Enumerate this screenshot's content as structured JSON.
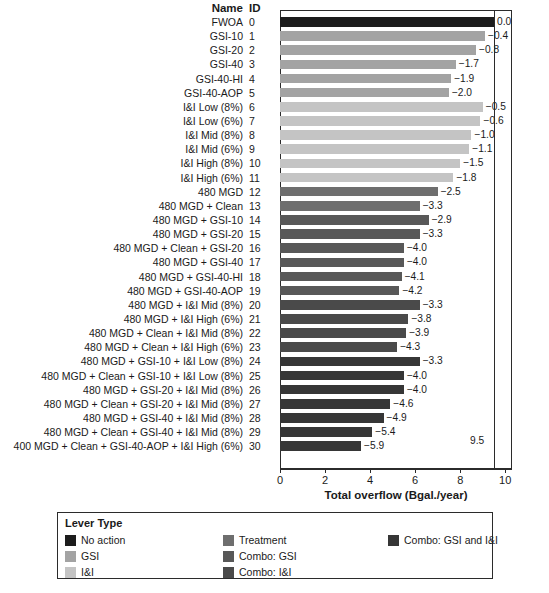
{
  "header": {
    "name_col": "Name",
    "id_col": "ID"
  },
  "chart_data": {
    "type": "bar",
    "title": "",
    "xlabel": "Total overflow (Bgal./year)",
    "ylabel": "",
    "xlim": [
      0,
      10.3
    ],
    "xticks": [
      0,
      2,
      4,
      6,
      8,
      10
    ],
    "xticklabels": [
      "0",
      "2",
      "4",
      "6",
      "8",
      "10"
    ],
    "grid": false,
    "orientation": "horizontal",
    "reference_line": {
      "value": 9.5,
      "label": "9.5"
    },
    "legend_position": "bottom",
    "categories": [
      "FWOA",
      "GSI-10",
      "GSI-20",
      "GSI-40",
      "GSI-40-HI",
      "GSI-40-AOP",
      "I&I Low (8%)",
      "I&I Low (6%)",
      "I&I Mid (8%)",
      "I&I Mid (6%)",
      "I&I High (8%)",
      "I&I High (6%)",
      "480 MGD",
      "480 MGD + Clean",
      "480 MGD + GSI-10",
      "480 MGD + GSI-20",
      "480 MGD + Clean + GSI-20",
      "480 MGD + GSI-40",
      "480 MGD + GSI-40-HI",
      "480 MGD + GSI-40-AOP",
      "480 MGD + I&I Mid (8%)",
      "480 MGD + I&I High (6%)",
      "480 MGD + Clean + I&I Mid (8%)",
      "480 MGD + Clean + I&I High (6%)",
      "480 MGD + GSI-10 + I&I Low (8%)",
      "480 MGD + Clean + GSI-10 + I&I Low (8%)",
      "480 MGD + GSI-20 + I&I Mid (8%)",
      "480 MGD + Clean + GSI-20 + I&I Mid (8%)",
      "480 MGD + GSI-40 + I&I Mid (8%)",
      "480 MGD + Clean + GSI-40 + I&I Mid (8%)",
      "400 MGD + Clean + GSI-40-AOP + I&I High (6%)"
    ],
    "ids": [
      0,
      1,
      2,
      3,
      4,
      5,
      6,
      7,
      8,
      9,
      10,
      11,
      12,
      13,
      14,
      15,
      16,
      17,
      18,
      19,
      20,
      21,
      22,
      23,
      24,
      25,
      26,
      27,
      28,
      29,
      30
    ],
    "values": [
      9.5,
      9.1,
      8.7,
      7.8,
      7.6,
      7.5,
      9.0,
      8.9,
      8.5,
      8.4,
      8.0,
      7.7,
      7.0,
      6.2,
      6.6,
      6.2,
      5.5,
      5.5,
      5.4,
      5.3,
      6.2,
      5.7,
      5.6,
      5.2,
      6.2,
      5.5,
      5.5,
      4.9,
      4.6,
      4.1,
      3.6
    ],
    "value_labels": [
      "0.0",
      "−0.4",
      "−0.8",
      "−1.7",
      "−1.9",
      "−2.0",
      "−0.5",
      "−0.6",
      "−1.0",
      "−1.1",
      "−1.5",
      "−1.8",
      "−2.5",
      "−3.3",
      "−2.9",
      "−3.3",
      "−4.0",
      "−4.0",
      "−4.1",
      "−4.2",
      "−3.3",
      "−3.8",
      "−3.9",
      "−4.3",
      "−3.3",
      "−4.0",
      "−4.0",
      "−4.6",
      "−4.9",
      "−5.4",
      "−5.9"
    ],
    "lever_types": [
      "No action",
      "GSI",
      "GSI",
      "GSI",
      "GSI",
      "GSI",
      "I&I",
      "I&I",
      "I&I",
      "I&I",
      "I&I",
      "I&I",
      "Treatment",
      "Treatment",
      "Combo: GSI",
      "Combo: GSI",
      "Combo: GSI",
      "Combo: GSI",
      "Combo: GSI",
      "Combo: GSI",
      "Combo: I&I",
      "Combo: I&I",
      "Combo: I&I",
      "Combo: I&I",
      "Combo: GSI and I&I",
      "Combo: GSI and I&I",
      "Combo: GSI and I&I",
      "Combo: GSI and I&I",
      "Combo: GSI and I&I",
      "Combo: GSI and I&I",
      "Combo: GSI and I&I"
    ]
  },
  "legend": {
    "title": "Lever Type",
    "items": [
      {
        "label": "No action",
        "color": "#1c1c1c",
        "col": 0,
        "row": 0
      },
      {
        "label": "GSI",
        "color": "#a3a3a3",
        "col": 0,
        "row": 1
      },
      {
        "label": "I&I",
        "color": "#c4c4c4",
        "col": 0,
        "row": 2
      },
      {
        "label": "Treatment",
        "color": "#6e6e6e",
        "col": 1,
        "row": 0
      },
      {
        "label": "Combo: GSI",
        "color": "#585858",
        "col": 1,
        "row": 1
      },
      {
        "label": "Combo: I&I",
        "color": "#4a4a4a",
        "col": 1,
        "row": 2
      },
      {
        "label": "Combo: GSI and I&I",
        "color": "#363636",
        "col": 2,
        "row": 0
      }
    ]
  },
  "colors": {
    "No action": "#1c1c1c",
    "GSI": "#a3a3a3",
    "I&I": "#c4c4c4",
    "Treatment": "#6e6e6e",
    "Combo: GSI": "#585858",
    "Combo: I&I": "#4a4a4a",
    "Combo: GSI and I&I": "#363636",
    "axis": "#2b2b2b"
  }
}
